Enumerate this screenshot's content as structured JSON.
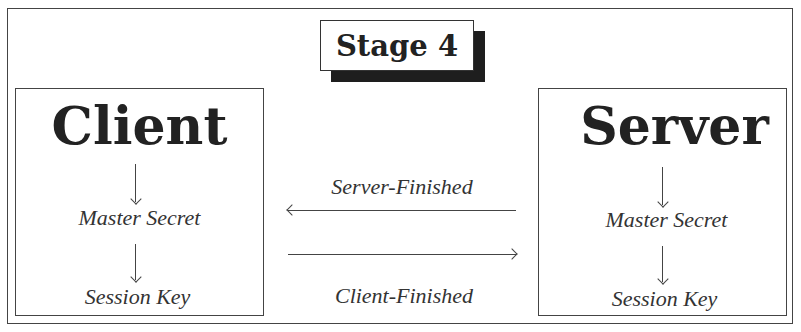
{
  "diagram": {
    "title": "Stage 4",
    "client": {
      "name": "Client",
      "steps": [
        "Master Secret",
        "Session Key"
      ]
    },
    "server": {
      "name": "Server",
      "steps": [
        "Master Secret",
        "Session Key"
      ]
    },
    "messages": [
      {
        "label": "Server-Finished",
        "direction": "server-to-client"
      },
      {
        "label": "Client-Finished",
        "direction": "client-to-server"
      }
    ]
  }
}
